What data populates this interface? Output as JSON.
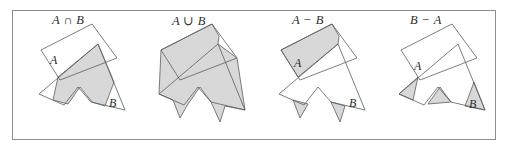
{
  "figure": {
    "kind": "set-operations-venn-illustration",
    "background_color": "#ffffff",
    "frame": {
      "x": 12,
      "y": 10,
      "width": 484,
      "height": 130,
      "border_color": "#8d8d91",
      "border_width": 1
    },
    "style": {
      "shade_fill": "#d8d8d8",
      "outline_stroke": "#5d5d62",
      "outline_width": 0.8,
      "text_color": "#2b2b2b"
    }
  },
  "panels": [
    {
      "id": "panel-intersection",
      "title": "A ∩ B",
      "operation": "intersection",
      "origin_x": 28,
      "origin_y": 22,
      "title_x": 52,
      "title_y": 13,
      "labels": [
        {
          "name": "label-a",
          "text": "A",
          "x": 22,
          "y": 42
        },
        {
          "name": "label-b",
          "text": "B",
          "x": 81,
          "y": 85
        }
      ],
      "polygon_a": "32,58 13,28 64,2 89,36",
      "polygon_b": "70,22 97,88 63,80 50,65 36,83 11,72",
      "shaded": [
        "70,22 86,60 77,84 64,80 52,65 40,82 25,78 30,55"
      ]
    },
    {
      "id": "panel-union",
      "title": "A ∪ B",
      "operation": "union",
      "origin_x": 148,
      "origin_y": 22,
      "title_x": 172,
      "title_y": 13,
      "labels": [],
      "polygon_a": "32,58 13,28 64,2 89,36",
      "polygon_b": "70,22 97,88 63,80 50,65 36,83 11,72",
      "shaded": [
        "64,2 13,28 11,72 25,78 32,96 40,82 52,65 63,80 72,100 77,84 97,88 89,36 70,22 71,14"
      ]
    },
    {
      "id": "panel-difference-ab",
      "title": "A − B",
      "operation": "difference-a-minus-b",
      "origin_x": 268,
      "origin_y": 22,
      "title_x": 292,
      "title_y": 13,
      "labels": [
        {
          "name": "label-a",
          "text": "A",
          "x": 26,
          "y": 45
        },
        {
          "name": "label-b",
          "text": "B",
          "x": 81,
          "y": 85
        }
      ],
      "polygon_a": "32,58 13,28 64,2 89,36",
      "polygon_b": "70,22 97,88 63,80 50,65 36,83 11,72",
      "shaded": [
        "64,2 13,28 30,55 70,22 71,14",
        "25,78 32,96 40,82",
        "63,80 72,100 77,84"
      ]
    },
    {
      "id": "panel-difference-ba",
      "title": "B − A",
      "operation": "difference-b-minus-a",
      "origin_x": 388,
      "origin_y": 22,
      "title_x": 410,
      "title_y": 13,
      "labels": [
        {
          "name": "label-a",
          "text": "A",
          "x": 26,
          "y": 48
        },
        {
          "name": "label-b",
          "text": "B",
          "x": 81,
          "y": 86
        }
      ],
      "polygon_a": "32,58 13,28 64,2 89,36",
      "polygon_b": "70,22 97,88 63,80 50,65 36,83 11,72",
      "shaded": [
        "86,60 97,88 77,84",
        "11,72 25,78 30,55",
        "40,82 52,65 63,80"
      ]
    }
  ]
}
